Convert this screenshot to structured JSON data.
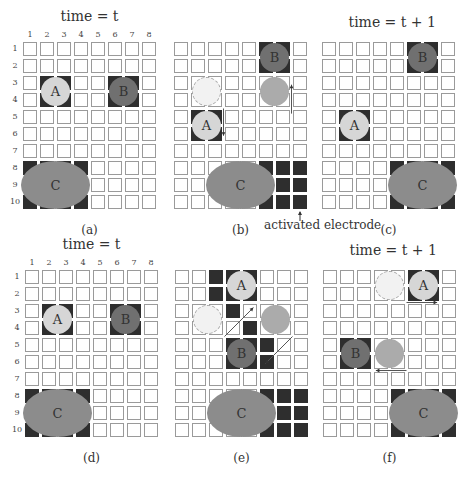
{
  "figure": {
    "grid": {
      "cols": 8,
      "rows": 10,
      "pitch": 17,
      "cell": 14
    },
    "column_labels": [
      "1",
      "2",
      "3",
      "4",
      "5",
      "6",
      "7",
      "8"
    ],
    "row_labels": [
      "1",
      "2",
      "3",
      "4",
      "5",
      "6",
      "7",
      "8",
      "9",
      "10"
    ],
    "colors": {
      "electrode_on": "#2e2e2e",
      "droplet_A": "#d6d6d6",
      "droplet_B": "#707070",
      "droplet_C": "#8c8c8c",
      "ghost_A": "#f2f2f2",
      "ghost_B": "#ababab"
    },
    "annotation": {
      "text": "activated electrode"
    },
    "panels": [
      {
        "id": "a",
        "caption": "(a)",
        "title": "time = t",
        "show_numbers": true,
        "x": 23,
        "y": 42,
        "active": [
          [
            3,
            2
          ],
          [
            3,
            3
          ],
          [
            4,
            2
          ],
          [
            4,
            3
          ],
          [
            3,
            6
          ],
          [
            3,
            7
          ],
          [
            4,
            6
          ],
          [
            4,
            7
          ],
          [
            8,
            1
          ],
          [
            8,
            2
          ],
          [
            8,
            3
          ],
          [
            8,
            4
          ],
          [
            9,
            1
          ],
          [
            9,
            2
          ],
          [
            9,
            3
          ],
          [
            9,
            4
          ],
          [
            10,
            1
          ],
          [
            10,
            2
          ],
          [
            10,
            3
          ],
          [
            10,
            4
          ]
        ],
        "droplets": [
          {
            "label": "A",
            "type": "A",
            "row": 3,
            "col": 2,
            "w": 2,
            "h": 2
          },
          {
            "label": "B",
            "type": "B",
            "row": 3,
            "col": 6,
            "w": 2,
            "h": 2
          },
          {
            "label": "C",
            "type": "C",
            "row": 8,
            "col": 1,
            "w": 4,
            "h": 3
          }
        ],
        "arrows": []
      },
      {
        "id": "b",
        "caption": "(b)",
        "title": "",
        "show_numbers": false,
        "x": 174,
        "y": 42,
        "active": [
          [
            1,
            6
          ],
          [
            1,
            7
          ],
          [
            2,
            6
          ],
          [
            2,
            7
          ],
          [
            5,
            2
          ],
          [
            5,
            3
          ],
          [
            6,
            2
          ],
          [
            6,
            3
          ],
          [
            8,
            6
          ],
          [
            8,
            7
          ],
          [
            8,
            8
          ],
          [
            9,
            6
          ],
          [
            9,
            7
          ],
          [
            9,
            8
          ],
          [
            10,
            6
          ],
          [
            10,
            7
          ],
          [
            10,
            8
          ]
        ],
        "droplets": [
          {
            "label": "",
            "type": "ghostA",
            "row": 3,
            "col": 2,
            "w": 2,
            "h": 2
          },
          {
            "label": "",
            "type": "ghostB",
            "row": 3,
            "col": 6,
            "w": 2,
            "h": 2
          },
          {
            "label": "A",
            "type": "A",
            "row": 5,
            "col": 2,
            "w": 2,
            "h": 2
          },
          {
            "label": "B",
            "type": "B",
            "row": 1,
            "col": 6,
            "w": 2,
            "h": 2
          },
          {
            "label": "C",
            "type": "C",
            "row": 8,
            "col": 3,
            "w": 4,
            "h": 3
          }
        ],
        "arrows": [
          {
            "from": [
              4,
              3
            ],
            "to": [
              5.6,
              3
            ]
          },
          {
            "from": [
              4.3,
              7
            ],
            "to": [
              2.6,
              7
            ]
          }
        ]
      },
      {
        "id": "c",
        "caption": "(c)",
        "title": "time = t + 1",
        "show_numbers": false,
        "x": 322,
        "y": 42,
        "active": [
          [
            1,
            6
          ],
          [
            1,
            7
          ],
          [
            2,
            6
          ],
          [
            2,
            7
          ],
          [
            5,
            2
          ],
          [
            5,
            3
          ],
          [
            6,
            2
          ],
          [
            6,
            3
          ],
          [
            8,
            5
          ],
          [
            8,
            6
          ],
          [
            8,
            7
          ],
          [
            8,
            8
          ],
          [
            9,
            5
          ],
          [
            9,
            8
          ],
          [
            10,
            5
          ],
          [
            10,
            6
          ],
          [
            10,
            7
          ],
          [
            10,
            8
          ]
        ],
        "droplets": [
          {
            "label": "A",
            "type": "A",
            "row": 5,
            "col": 2,
            "w": 2,
            "h": 2
          },
          {
            "label": "B",
            "type": "B",
            "row": 1,
            "col": 6,
            "w": 2,
            "h": 2
          },
          {
            "label": "C",
            "type": "C",
            "row": 8,
            "col": 5,
            "w": 4,
            "h": 3
          }
        ],
        "arrows": []
      },
      {
        "id": "d",
        "caption": "(d)",
        "title": "time = t",
        "show_numbers": true,
        "x": 25,
        "y": 270,
        "active": [
          [
            3,
            2
          ],
          [
            3,
            3
          ],
          [
            4,
            2
          ],
          [
            4,
            3
          ],
          [
            3,
            6
          ],
          [
            3,
            7
          ],
          [
            4,
            6
          ],
          [
            4,
            7
          ],
          [
            8,
            1
          ],
          [
            8,
            2
          ],
          [
            8,
            3
          ],
          [
            8,
            4
          ],
          [
            9,
            1
          ],
          [
            9,
            2
          ],
          [
            9,
            3
          ],
          [
            9,
            4
          ],
          [
            10,
            1
          ],
          [
            10,
            2
          ],
          [
            10,
            3
          ],
          [
            10,
            4
          ]
        ],
        "droplets": [
          {
            "label": "A",
            "type": "A",
            "row": 3,
            "col": 2,
            "w": 2,
            "h": 2
          },
          {
            "label": "B",
            "type": "B",
            "row": 3,
            "col": 6,
            "w": 2,
            "h": 2
          },
          {
            "label": "C",
            "type": "C",
            "row": 8,
            "col": 1,
            "w": 4,
            "h": 3
          }
        ],
        "arrows": []
      },
      {
        "id": "e",
        "caption": "(e)",
        "title": "",
        "show_numbers": false,
        "x": 175,
        "y": 270,
        "active": [
          [
            1,
            3
          ],
          [
            1,
            4
          ],
          [
            1,
            5
          ],
          [
            2,
            3
          ],
          [
            2,
            4
          ],
          [
            2,
            5
          ],
          [
            3,
            4
          ],
          [
            4,
            5
          ],
          [
            5,
            4
          ],
          [
            5,
            5
          ],
          [
            5,
            6
          ],
          [
            6,
            4
          ],
          [
            6,
            5
          ],
          [
            6,
            6
          ],
          [
            8,
            6
          ],
          [
            8,
            7
          ],
          [
            8,
            8
          ],
          [
            9,
            6
          ],
          [
            9,
            7
          ],
          [
            9,
            8
          ],
          [
            10,
            6
          ],
          [
            10,
            7
          ],
          [
            10,
            8
          ]
        ],
        "droplets": [
          {
            "label": "",
            "type": "ghostA",
            "row": 3,
            "col": 2,
            "w": 2,
            "h": 2
          },
          {
            "label": "",
            "type": "ghostB",
            "row": 3,
            "col": 6,
            "w": 2,
            "h": 2
          },
          {
            "label": "A",
            "type": "A",
            "row": 1,
            "col": 4,
            "w": 2,
            "h": 2
          },
          {
            "label": "B",
            "type": "B",
            "row": 5,
            "col": 4,
            "w": 2,
            "h": 2
          },
          {
            "label": "C",
            "type": "C",
            "row": 8,
            "col": 3,
            "w": 4,
            "h": 3
          }
        ],
        "arrows": [
          {
            "from": [
              4,
              3
            ],
            "to": [
              2.3,
              4.7
            ]
          },
          {
            "from": [
              4,
              7
            ],
            "to": [
              5.6,
              5.4
            ]
          }
        ]
      },
      {
        "id": "f",
        "caption": "(f)",
        "title": "time = t + 1",
        "show_numbers": false,
        "x": 323,
        "y": 270,
        "active": [
          [
            1,
            6
          ],
          [
            1,
            7
          ],
          [
            2,
            6
          ],
          [
            2,
            7
          ],
          [
            5,
            2
          ],
          [
            5,
            3
          ],
          [
            6,
            2
          ],
          [
            6,
            3
          ],
          [
            8,
            5
          ],
          [
            8,
            6
          ],
          [
            8,
            7
          ],
          [
            8,
            8
          ],
          [
            9,
            5
          ],
          [
            9,
            8
          ],
          [
            10,
            5
          ],
          [
            10,
            6
          ],
          [
            10,
            7
          ],
          [
            10,
            8
          ]
        ],
        "droplets": [
          {
            "label": "",
            "type": "ghostA",
            "row": 1,
            "col": 4,
            "w": 2,
            "h": 2
          },
          {
            "label": "",
            "type": "ghostB",
            "row": 5,
            "col": 4,
            "w": 2,
            "h": 2
          },
          {
            "label": "A",
            "type": "A",
            "row": 1,
            "col": 6,
            "w": 2,
            "h": 2
          },
          {
            "label": "B",
            "type": "B",
            "row": 5,
            "col": 2,
            "w": 2,
            "h": 2
          },
          {
            "label": "C",
            "type": "C",
            "row": 8,
            "col": 5,
            "w": 4,
            "h": 3
          }
        ],
        "arrows": [
          {
            "from": [
              2,
              5
            ],
            "to": [
              2,
              6.8
            ]
          },
          {
            "from": [
              6,
              5
            ],
            "to": [
              6,
              3.2
            ]
          }
        ]
      }
    ]
  }
}
